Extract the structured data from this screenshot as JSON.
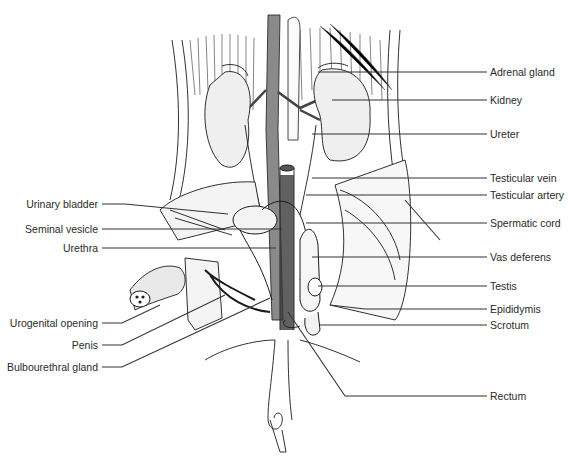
{
  "figure": {
    "labels_right": [
      {
        "id": "adrenal-gland",
        "text": "Adrenal gland",
        "y": 72
      },
      {
        "id": "kidney",
        "text": "Kidney",
        "y": 100
      },
      {
        "id": "ureter",
        "text": "Ureter",
        "y": 134
      },
      {
        "id": "testicular-vein",
        "text": "Testicular vein",
        "y": 178
      },
      {
        "id": "testicular-artery",
        "text": "Testicular artery",
        "y": 195
      },
      {
        "id": "spermatic-cord",
        "text": "Spermatic cord",
        "y": 223
      },
      {
        "id": "vas-deferens",
        "text": "Vas deferens",
        "y": 257
      },
      {
        "id": "testis",
        "text": "Testis",
        "y": 286
      },
      {
        "id": "epididymis",
        "text": "Epididymis",
        "y": 309
      },
      {
        "id": "scrotum",
        "text": "Scrotum",
        "y": 325
      },
      {
        "id": "rectum",
        "text": "Rectum",
        "y": 396
      }
    ],
    "labels_left": [
      {
        "id": "urinary-bladder",
        "text": "Urinary bladder",
        "y": 204
      },
      {
        "id": "seminal-vesicle",
        "text": "Seminal vesicle",
        "y": 229
      },
      {
        "id": "urethra",
        "text": "Urethra",
        "y": 248
      },
      {
        "id": "urogenital-opening",
        "text": "Urogenital opening",
        "y": 323
      },
      {
        "id": "penis",
        "text": "Penis",
        "y": 345
      },
      {
        "id": "bulbourethral-gland",
        "text": "Bulbourethral gland",
        "y": 367
      }
    ]
  }
}
